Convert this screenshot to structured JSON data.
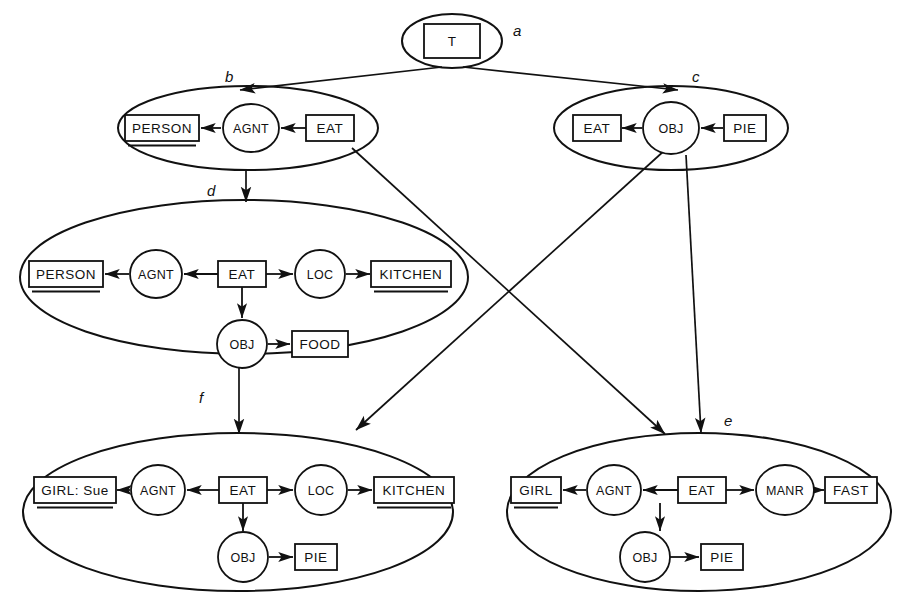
{
  "diagram": {
    "background_color": "#ffffff",
    "line_color": "#111111",
    "width": 918,
    "height": 608
  },
  "lattice_labels": [
    {
      "id": "a",
      "text": "a",
      "x": 513,
      "y": 22
    },
    {
      "id": "b",
      "text": "b",
      "x": 225,
      "y": 68
    },
    {
      "id": "c",
      "text": "c",
      "x": 692,
      "y": 68
    },
    {
      "id": "d",
      "text": "d",
      "x": 207,
      "y": 182
    },
    {
      "id": "e",
      "text": "e",
      "x": 724,
      "y": 412
    },
    {
      "id": "f",
      "text": "f",
      "x": 199,
      "y": 389
    }
  ],
  "contexts": [
    {
      "id": "a",
      "label": "a",
      "cx": 452,
      "cy": 41,
      "rx": 50,
      "ry": 27,
      "concepts": [
        {
          "name": "universal-type",
          "text": "T",
          "cx": 452,
          "cy": 41,
          "w": 56,
          "h": 34,
          "referent": false
        }
      ],
      "relations": [],
      "edges": []
    },
    {
      "id": "b",
      "label": "b",
      "cx": 248,
      "cy": 128,
      "rx": 130,
      "ry": 42,
      "concepts": [
        {
          "name": "person",
          "text": "PERSON",
          "cx": 162,
          "cy": 128,
          "w": 74,
          "h": 26,
          "referent": true
        },
        {
          "name": "eat",
          "text": "EAT",
          "cx": 330,
          "cy": 128,
          "w": 48,
          "h": 26,
          "referent": false
        }
      ],
      "relations": [
        {
          "name": "agnt",
          "text": "AGNT",
          "cx": 251,
          "cy": 128,
          "rx": 28,
          "ry": 24
        }
      ],
      "edges": [
        {
          "from": "eat",
          "to": "agnt",
          "x1": 306,
          "y1": 128,
          "x2": 281,
          "y2": 128,
          "arrow": "end"
        },
        {
          "from": "agnt",
          "to": "person",
          "x1": 221,
          "y1": 128,
          "x2": 201,
          "y2": 128,
          "arrow": "end"
        }
      ]
    },
    {
      "id": "c",
      "label": "c",
      "cx": 671,
      "cy": 128,
      "rx": 117,
      "ry": 42,
      "concepts": [
        {
          "name": "eat",
          "text": "EAT",
          "cx": 597,
          "cy": 128,
          "w": 48,
          "h": 26,
          "referent": false
        },
        {
          "name": "pie",
          "text": "PIE",
          "cx": 745,
          "cy": 128,
          "w": 42,
          "h": 26,
          "referent": false
        }
      ],
      "relations": [
        {
          "name": "obj",
          "text": "OBJ",
          "cx": 671,
          "cy": 128,
          "rx": 28,
          "ry": 26
        }
      ],
      "edges": [
        {
          "from": "pie",
          "to": "obj",
          "x1": 723,
          "y1": 128,
          "x2": 701,
          "y2": 128,
          "arrow": "end"
        },
        {
          "from": "obj",
          "to": "eat",
          "x1": 642,
          "y1": 128,
          "x2": 622,
          "y2": 128,
          "arrow": "end"
        }
      ]
    },
    {
      "id": "d",
      "label": "d",
      "cx": 244,
      "cy": 277,
      "rx": 224,
      "ry": 77,
      "concepts": [
        {
          "name": "person",
          "text": "PERSON",
          "cx": 66,
          "cy": 274,
          "w": 74,
          "h": 26,
          "referent": true
        },
        {
          "name": "eat",
          "text": "EAT",
          "cx": 242,
          "cy": 274,
          "w": 48,
          "h": 26,
          "referent": false
        },
        {
          "name": "kitchen",
          "text": "KITCHEN",
          "cx": 411,
          "cy": 274,
          "w": 80,
          "h": 26,
          "referent": true
        },
        {
          "name": "food",
          "text": "FOOD",
          "cx": 320,
          "cy": 344,
          "w": 56,
          "h": 26,
          "referent": false
        }
      ],
      "relations": [
        {
          "name": "agnt",
          "text": "AGNT",
          "cx": 156,
          "cy": 274,
          "rx": 26,
          "ry": 24
        },
        {
          "name": "loc",
          "text": "LOC",
          "cx": 320,
          "cy": 274,
          "rx": 25,
          "ry": 24
        },
        {
          "name": "obj",
          "text": "OBJ",
          "cx": 242,
          "cy": 344,
          "rx": 25,
          "ry": 24
        }
      ],
      "edges": [
        {
          "from": "eat",
          "to": "agnt",
          "x1": 218,
          "y1": 274,
          "x2": 184,
          "y2": 274,
          "arrow": "end"
        },
        {
          "from": "agnt",
          "to": "person",
          "x1": 129,
          "y1": 274,
          "x2": 105,
          "y2": 274,
          "arrow": "end"
        },
        {
          "from": "eat",
          "to": "loc",
          "x1": 266,
          "y1": 274,
          "x2": 293,
          "y2": 274,
          "arrow": "end"
        },
        {
          "from": "loc",
          "to": "kitchen",
          "x1": 346,
          "y1": 274,
          "x2": 370,
          "y2": 274,
          "arrow": "end"
        },
        {
          "from": "eat",
          "to": "obj",
          "x1": 242,
          "y1": 287,
          "x2": 242,
          "y2": 318,
          "arrow": "end"
        },
        {
          "from": "obj",
          "to": "food",
          "x1": 268,
          "y1": 344,
          "x2": 290,
          "y2": 344,
          "arrow": "end"
        }
      ]
    },
    {
      "id": "e",
      "label": "e",
      "cx": 699,
      "cy": 512,
      "rx": 192,
      "ry": 79,
      "concepts": [
        {
          "name": "girl",
          "text": "GIRL",
          "cx": 536,
          "cy": 490,
          "w": 50,
          "h": 26,
          "referent": true
        },
        {
          "name": "eat",
          "text": "EAT",
          "cx": 702,
          "cy": 490,
          "w": 48,
          "h": 26,
          "referent": false
        },
        {
          "name": "fast",
          "text": "FAST",
          "cx": 851,
          "cy": 490,
          "w": 52,
          "h": 26,
          "referent": false
        },
        {
          "name": "pie",
          "text": "PIE",
          "cx": 722,
          "cy": 557,
          "w": 42,
          "h": 26,
          "referent": false
        }
      ],
      "relations": [
        {
          "name": "agnt",
          "text": "AGNT",
          "cx": 614,
          "cy": 490,
          "rx": 27,
          "ry": 25
        },
        {
          "name": "manr",
          "text": "MANR",
          "cx": 785,
          "cy": 490,
          "rx": 29,
          "ry": 25
        },
        {
          "name": "obj",
          "text": "OBJ",
          "cx": 645,
          "cy": 557,
          "rx": 25,
          "ry": 25
        }
      ],
      "edges": [
        {
          "from": "eat",
          "to": "agnt",
          "x1": 678,
          "y1": 490,
          "x2": 643,
          "y2": 490,
          "arrow": "end"
        },
        {
          "from": "agnt",
          "to": "girl",
          "x1": 586,
          "y1": 490,
          "x2": 563,
          "y2": 490,
          "arrow": "end"
        },
        {
          "from": "eat",
          "to": "manr",
          "x1": 726,
          "y1": 490,
          "x2": 754,
          "y2": 490,
          "arrow": "end"
        },
        {
          "from": "manr",
          "to": "fast",
          "x1": 815,
          "y1": 490,
          "x2": 824,
          "y2": 490,
          "arrow": "end"
        },
        {
          "from": "eat",
          "to": "obj",
          "x1": 660,
          "y1": 503,
          "x2": 660,
          "y2": 531,
          "arrow": "end"
        },
        {
          "from": "obj",
          "to": "pie",
          "x1": 670,
          "y1": 557,
          "x2": 699,
          "y2": 557,
          "arrow": "end"
        }
      ]
    },
    {
      "id": "f",
      "label": "f",
      "cx": 238,
      "cy": 512,
      "rx": 215,
      "ry": 79,
      "concepts": [
        {
          "name": "girl-sue",
          "text": "GIRL: Sue",
          "cx": 75,
          "cy": 490,
          "w": 82,
          "h": 26,
          "referent": true
        },
        {
          "name": "eat",
          "text": "EAT",
          "cx": 243,
          "cy": 490,
          "w": 48,
          "h": 26,
          "referent": false
        },
        {
          "name": "kitchen",
          "text": "KITCHEN",
          "cx": 414,
          "cy": 490,
          "w": 80,
          "h": 26,
          "referent": true
        },
        {
          "name": "pie",
          "text": "PIE",
          "cx": 316,
          "cy": 557,
          "w": 42,
          "h": 26,
          "referent": false
        }
      ],
      "relations": [
        {
          "name": "agnt",
          "text": "AGNT",
          "cx": 158,
          "cy": 490,
          "rx": 27,
          "ry": 25
        },
        {
          "name": "loc",
          "text": "LOC",
          "cx": 321,
          "cy": 490,
          "rx": 26,
          "ry": 25
        },
        {
          "name": "obj",
          "text": "OBJ",
          "cx": 243,
          "cy": 557,
          "rx": 25,
          "ry": 25
        }
      ],
      "edges": [
        {
          "from": "eat",
          "to": "agnt",
          "x1": 219,
          "y1": 490,
          "x2": 187,
          "y2": 490,
          "arrow": "end"
        },
        {
          "from": "agnt",
          "to": "girl-sue",
          "x1": 130,
          "y1": 490,
          "x2": 117,
          "y2": 490,
          "arrow": "end"
        },
        {
          "from": "eat",
          "to": "loc",
          "x1": 267,
          "y1": 490,
          "x2": 293,
          "y2": 490,
          "arrow": "end"
        },
        {
          "from": "loc",
          "to": "kitchen",
          "x1": 348,
          "y1": 490,
          "x2": 372,
          "y2": 490,
          "arrow": "end"
        },
        {
          "from": "eat",
          "to": "obj",
          "x1": 243,
          "y1": 503,
          "x2": 243,
          "y2": 531,
          "arrow": "end"
        },
        {
          "from": "obj",
          "to": "pie",
          "x1": 269,
          "y1": 557,
          "x2": 293,
          "y2": 557,
          "arrow": "end"
        }
      ]
    }
  ],
  "lattice_edges": [
    {
      "name": "a-to-b",
      "from": "a",
      "to": "b",
      "x1": 442,
      "y1": 67,
      "x2": 240,
      "y2": 90
    },
    {
      "name": "a-to-c",
      "from": "a",
      "to": "c",
      "x1": 463,
      "y1": 67,
      "x2": 678,
      "y2": 90
    },
    {
      "name": "b-to-d",
      "from": "b",
      "to": "d",
      "x1": 246,
      "y1": 169,
      "x2": 246,
      "y2": 202
    },
    {
      "name": "b-to-e",
      "from": "b",
      "to": "e",
      "x1": 352,
      "y1": 148,
      "x2": 665,
      "y2": 434
    },
    {
      "name": "c-to-f",
      "from": "c",
      "to": "f",
      "x1": 665,
      "y1": 150,
      "x2": 356,
      "y2": 430
    },
    {
      "name": "c-to-e",
      "from": "c",
      "to": "e",
      "x1": 686,
      "y1": 155,
      "x2": 701,
      "y2": 433
    },
    {
      "name": "d-to-f",
      "from": "d",
      "to": "f",
      "x1": 239,
      "y1": 354,
      "x2": 239,
      "y2": 434
    }
  ]
}
